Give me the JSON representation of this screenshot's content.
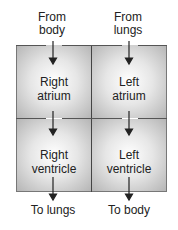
{
  "diagram": {
    "inputs": [
      {
        "label_line1": "From",
        "label_line2": "body"
      },
      {
        "label_line1": "From",
        "label_line2": "lungs"
      }
    ],
    "chambers": [
      {
        "line1": "Right",
        "line2": "atrium"
      },
      {
        "line1": "Left",
        "line2": "atrium"
      },
      {
        "line1": "Right",
        "line2": "ventricle"
      },
      {
        "line1": "Left",
        "line2": "ventricle"
      }
    ],
    "outputs": [
      {
        "label": "To lungs"
      },
      {
        "label": "To body"
      }
    ],
    "colors": {
      "border": "#555555",
      "fill_edge": "#b5b5b5",
      "fill_center": "#ffffff",
      "arrow": "#222222"
    }
  }
}
